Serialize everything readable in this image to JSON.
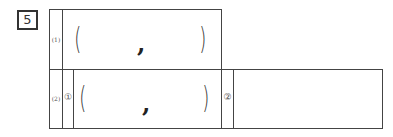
{
  "question_number": "5",
  "rows": [
    {
      "label": "(1)",
      "answer": {
        "open": "(",
        "separator": ",",
        "close": ")"
      }
    },
    {
      "label": "(2)",
      "parts": [
        {
          "marker": "①",
          "answer": {
            "open": "(",
            "separator": ",",
            "close": ")"
          }
        },
        {
          "marker": "②",
          "answer": ""
        }
      ]
    }
  ],
  "colors": {
    "line": "#444444",
    "background": "#ffffff"
  }
}
